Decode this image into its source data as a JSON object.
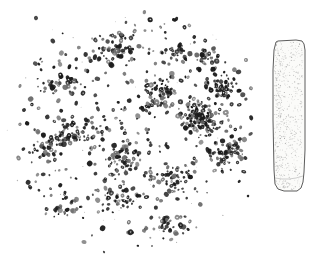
{
  "figure": {
    "title": "",
    "caption": "",
    "background_color": "#ffffff",
    "width": 319,
    "height": 261
  },
  "panels": [
    {
      "id": "grain-scatter",
      "name": "grain-scatter-panel",
      "label": "",
      "description": "Circular scatter of dark mineral grains / particles",
      "shape": "circular-cloud",
      "grain_color": "#1a1a1a",
      "grain_color_light": "#6e6e6e",
      "grain_count": 860,
      "center_x": 133,
      "center_y": 126,
      "radius_x": 120,
      "radius_y": 120
    },
    {
      "id": "stone-tool",
      "name": "stone-tool-panel",
      "label": "",
      "description": "Stippled line drawing of an elongated stone adze blade",
      "outline_color": "#4a4a4a",
      "fill_color": "#fbfbf9",
      "stipple_color": "#9a9a9a",
      "top_y": 40,
      "bottom_y": 192,
      "left_x": 10,
      "right_x": 44
    }
  ],
  "chart_data": {
    "type": "scatter",
    "title": "",
    "xlabel": "",
    "ylabel": "",
    "grid": false,
    "legend": null,
    "axis_visible": false,
    "xlim": [
      0,
      262
    ],
    "ylim": [
      0,
      261
    ],
    "clusters": [
      {
        "cx": 200,
        "cy": 118,
        "rx": 22,
        "ry": 20,
        "n": 120,
        "density": "very-high"
      },
      {
        "cx": 160,
        "cy": 95,
        "rx": 26,
        "ry": 22,
        "n": 70,
        "density": "high"
      },
      {
        "cx": 222,
        "cy": 88,
        "rx": 20,
        "ry": 18,
        "n": 55,
        "density": "high"
      },
      {
        "cx": 228,
        "cy": 152,
        "rx": 24,
        "ry": 22,
        "n": 60,
        "density": "high"
      },
      {
        "cx": 120,
        "cy": 48,
        "rx": 24,
        "ry": 18,
        "n": 50,
        "density": "medium"
      },
      {
        "cx": 78,
        "cy": 132,
        "rx": 26,
        "ry": 22,
        "n": 55,
        "density": "medium"
      },
      {
        "cx": 48,
        "cy": 148,
        "rx": 20,
        "ry": 18,
        "n": 40,
        "density": "medium"
      },
      {
        "cx": 120,
        "cy": 160,
        "rx": 28,
        "ry": 22,
        "n": 50,
        "density": "medium"
      },
      {
        "cx": 172,
        "cy": 180,
        "rx": 26,
        "ry": 20,
        "n": 45,
        "density": "medium"
      },
      {
        "cx": 118,
        "cy": 200,
        "rx": 30,
        "ry": 18,
        "n": 40,
        "density": "medium"
      },
      {
        "cx": 66,
        "cy": 208,
        "rx": 20,
        "ry": 14,
        "n": 26,
        "density": "low"
      },
      {
        "cx": 168,
        "cy": 228,
        "rx": 26,
        "ry": 14,
        "n": 30,
        "density": "low"
      },
      {
        "cx": 62,
        "cy": 84,
        "rx": 22,
        "ry": 18,
        "n": 32,
        "density": "low"
      },
      {
        "cx": 176,
        "cy": 50,
        "rx": 20,
        "ry": 16,
        "n": 30,
        "density": "low"
      },
      {
        "cx": 208,
        "cy": 58,
        "rx": 16,
        "ry": 14,
        "n": 22,
        "density": "low"
      }
    ],
    "scatter_background_n": 300,
    "outliers": [
      {
        "x": 104,
        "y": 252
      },
      {
        "x": 84,
        "y": 242
      },
      {
        "x": 152,
        "y": 246
      },
      {
        "x": 24,
        "y": 110
      },
      {
        "x": 20,
        "y": 86
      },
      {
        "x": 248,
        "y": 196
      },
      {
        "x": 246,
        "y": 60
      },
      {
        "x": 36,
        "y": 18
      }
    ]
  },
  "tool_data": {
    "type": "line-drawing",
    "outline_points": "14,42 16,41 34,40 40,41 42,44 43,50 43,150 42,172 41,182 39,188 35,191 22,191 16,189 13,184 12,170 11,120 11,70 12,50",
    "stipple_count": 520,
    "inner_shading_left": true,
    "bevel_line_y": 178
  }
}
